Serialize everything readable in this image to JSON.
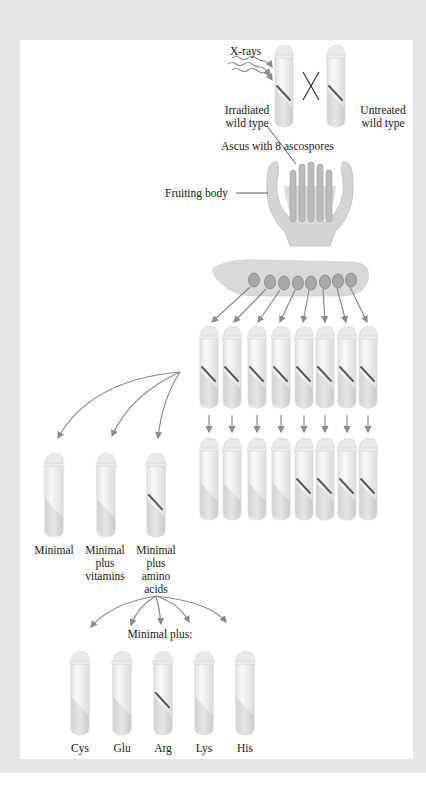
{
  "figure": {
    "top": {
      "xrays_label": "X-rays",
      "irradiated_label_1": "Irradiated",
      "irradiated_label_2": "wild type",
      "untreated_label_1": "Untreated",
      "untreated_label_2": "wild type",
      "cross_symbol": "X"
    },
    "fruiting": {
      "ascus_label": "Ascus with 8 ascospores",
      "fruiting_body_label": "Fruiting body"
    },
    "ascospore_count": 8,
    "row1_tubes": [
      {
        "growth": true
      },
      {
        "growth": true
      },
      {
        "growth": true
      },
      {
        "growth": true
      },
      {
        "growth": true
      },
      {
        "growth": true
      },
      {
        "growth": true
      },
      {
        "growth": true
      }
    ],
    "row2_tubes": [
      {
        "growth": false
      },
      {
        "growth": false
      },
      {
        "growth": false
      },
      {
        "growth": false
      },
      {
        "growth": true
      },
      {
        "growth": true
      },
      {
        "growth": true
      },
      {
        "growth": true
      }
    ],
    "media_tests": [
      {
        "line1": "Minimal",
        "line2": "",
        "line3": "",
        "line4": "",
        "growth": false
      },
      {
        "line1": "Minimal",
        "line2": "plus",
        "line3": "vitamins",
        "line4": "",
        "growth": false
      },
      {
        "line1": "Minimal",
        "line2": "plus",
        "line3": "amino",
        "line4": "acids",
        "growth": true
      }
    ],
    "minimal_plus_label": "Minimal plus:",
    "amino_tests": [
      {
        "label": "Cys",
        "growth": false
      },
      {
        "label": "Glu",
        "growth": false
      },
      {
        "label": "Arg",
        "growth": true
      },
      {
        "label": "Lys",
        "growth": false
      },
      {
        "label": "His",
        "growth": false
      }
    ],
    "colors": {
      "frame": "#e6e6e6",
      "arrow": "#8a8a8a",
      "tube_glass": "#f1f1f1",
      "agar": "#d6d6d6",
      "growth": "#5a5a5a",
      "fruiting_body": "#cfcfcf"
    }
  }
}
